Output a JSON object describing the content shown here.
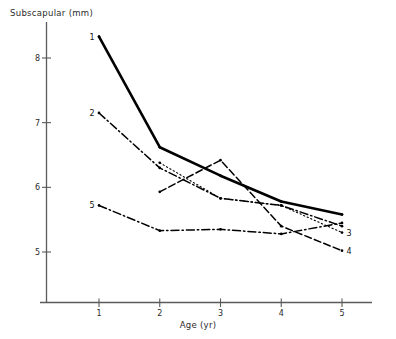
{
  "chart_data": {
    "type": "line",
    "title": "",
    "xlabel": "Age (yr)",
    "ylabel": "Subscapular (mm)",
    "xlim": [
      0.55,
      5.45
    ],
    "ylim": [
      4.45,
      8.62
    ],
    "xticks": [
      1,
      2,
      3,
      4,
      5
    ],
    "yticks": [
      5,
      6,
      7,
      8
    ],
    "xtick_labels": [
      "1",
      "2",
      "3",
      "4",
      "5"
    ],
    "ytick_labels": [
      "5",
      "6",
      "7",
      "8"
    ],
    "grid": false,
    "legend": "inline-endpoint-labels",
    "x": [
      1,
      2,
      3,
      4,
      5
    ],
    "series": [
      {
        "name": "1",
        "label": "1",
        "label_position": "start",
        "style": "solid",
        "width": 2.6,
        "color": "#000000",
        "values": [
          8.33,
          6.62,
          6.18,
          5.78,
          5.58
        ]
      },
      {
        "name": "2",
        "label": "2",
        "label_position": "start",
        "style": "dash-dot",
        "width": 1.5,
        "color": "#000000",
        "values": [
          7.15,
          6.3,
          5.83,
          5.72,
          5.4
        ]
      },
      {
        "name": "3",
        "label": "3",
        "label_position": "end",
        "style": "dotted",
        "width": 1.1,
        "color": "#000000",
        "values": [
          null,
          6.38,
          5.83,
          5.72,
          5.3
        ]
      },
      {
        "name": "4",
        "label": "4",
        "label_position": "end",
        "style": "dashed",
        "width": 1.5,
        "color": "#000000",
        "values": [
          null,
          5.93,
          6.42,
          5.4,
          5.02
        ]
      },
      {
        "name": "5",
        "label": "5",
        "label_position": "start",
        "style": "dash-dot",
        "width": 1.5,
        "color": "#000000",
        "values": [
          5.72,
          5.33,
          5.35,
          5.28,
          5.45
        ]
      }
    ],
    "marker": "dot",
    "axis_color": "#4a4a4a",
    "background": "#ffffff"
  }
}
